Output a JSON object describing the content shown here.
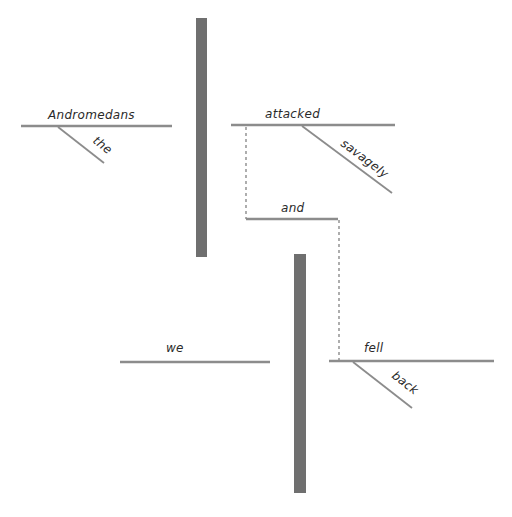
{
  "diagram": {
    "type": "sentence-diagram",
    "sentence": "The Andromedans attacked savagely and we fell back.",
    "clauses": [
      {
        "subject": "Andromedans",
        "subject_modifiers": [
          "the"
        ],
        "predicate": "attacked",
        "predicate_modifiers": [
          "savagely"
        ]
      },
      {
        "subject": "we",
        "subject_modifiers": [],
        "predicate": "fell",
        "predicate_modifiers": [
          "back"
        ]
      }
    ],
    "conjunction": "and",
    "words": {
      "andromedans": "Andromedans",
      "the": "the",
      "attacked": "attacked",
      "savagely": "savagely",
      "and": "and",
      "we": "we",
      "fell": "fell",
      "back": "back"
    },
    "colors": {
      "line": "#8c8c8c",
      "divider": "#6f6f6f",
      "text": "#2a2a2a",
      "background": "#ffffff"
    }
  }
}
